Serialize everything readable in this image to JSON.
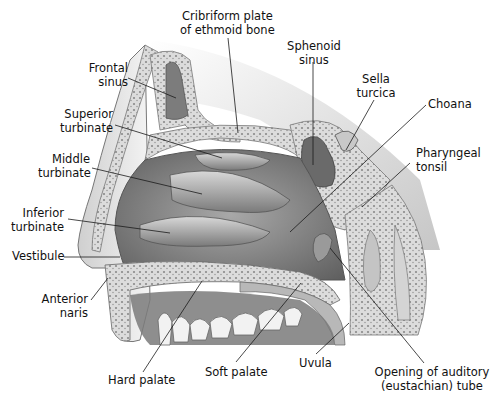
{
  "figure": {
    "colors": {
      "background": "#ffffff",
      "label_text": "#111111",
      "leader_line": "#1a1a1a",
      "bone_light": "#e6e6e6",
      "bone_pore": "#8a8a8a",
      "mucosa_mid": "#9a9a9a",
      "cavity_dark": "#6e6e6e",
      "teeth": "#f2f2f2"
    }
  },
  "labels": [
    {
      "id": "cribriform",
      "lines": [
        "Cribriform plate",
        "of ethmoid bone"
      ]
    },
    {
      "id": "frontal",
      "lines": [
        "Frontal",
        "sinus"
      ]
    },
    {
      "id": "sphenoid",
      "lines": [
        "Sphenoid",
        "sinus"
      ]
    },
    {
      "id": "sella",
      "lines": [
        "Sella",
        "turcica"
      ]
    },
    {
      "id": "superior",
      "lines": [
        "Superior",
        "turbinate"
      ]
    },
    {
      "id": "choana",
      "lines": [
        "Choana"
      ]
    },
    {
      "id": "middle",
      "lines": [
        "Middle",
        "turbinate"
      ]
    },
    {
      "id": "pharyngeal",
      "lines": [
        "Pharyngeal",
        "tonsil"
      ]
    },
    {
      "id": "inferior",
      "lines": [
        "Inferior",
        "turbinate"
      ]
    },
    {
      "id": "vestibule",
      "lines": [
        "Vestibule"
      ]
    },
    {
      "id": "naris",
      "lines": [
        "Anterior",
        "naris"
      ]
    },
    {
      "id": "hard",
      "lines": [
        "Hard palate"
      ]
    },
    {
      "id": "soft",
      "lines": [
        "Soft palate"
      ]
    },
    {
      "id": "uvula",
      "lines": [
        "Uvula"
      ]
    },
    {
      "id": "auditory",
      "lines": [
        "Opening of auditory",
        "(eustachian) tube"
      ]
    }
  ]
}
